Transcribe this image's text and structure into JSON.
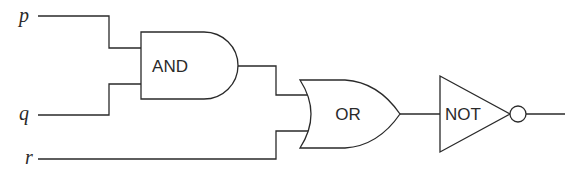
{
  "diagram": {
    "type": "logic-circuit",
    "inputs": [
      {
        "id": "p",
        "label": "p"
      },
      {
        "id": "q",
        "label": "q"
      },
      {
        "id": "r",
        "label": "r"
      }
    ],
    "gates": [
      {
        "id": "and",
        "label": "AND",
        "inputs": [
          "p",
          "q"
        ]
      },
      {
        "id": "or",
        "label": "OR",
        "inputs": [
          "and",
          "r"
        ]
      },
      {
        "id": "not",
        "label": "NOT",
        "inputs": [
          "or"
        ]
      }
    ],
    "output": "not",
    "colors": {
      "stroke": "#2a2a2a",
      "background": "#ffffff"
    }
  }
}
